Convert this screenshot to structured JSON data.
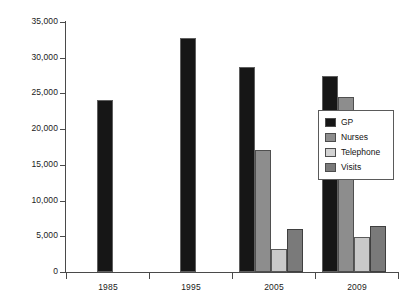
{
  "chart_data": {
    "type": "bar",
    "title": "",
    "subtitle": "",
    "xlabel": "",
    "ylabel": "",
    "categories": [
      "1985",
      "1995",
      "2005",
      "2009"
    ],
    "series": [
      {
        "name": "GP",
        "color": "#161616",
        "values": [
          24100,
          32800,
          28700,
          27450
        ]
      },
      {
        "name": "Nurses",
        "color": "#8d8d8d",
        "values": [
          null,
          null,
          17050,
          24450
        ]
      },
      {
        "name": "Telephone",
        "color": "#c9c9c9",
        "values": [
          null,
          null,
          3200,
          4900
        ]
      },
      {
        "name": "Visits",
        "color": "#7a7a7a",
        "values": [
          null,
          null,
          5950,
          6400
        ]
      }
    ],
    "ylim": [
      0,
      35000
    ],
    "ytick_values": [
      0,
      5000,
      10000,
      15000,
      20000,
      25000,
      30000,
      35000
    ],
    "ytick_labels": [
      "0",
      "5,000",
      "10,000",
      "15,000",
      "20,000",
      "25,000",
      "30,000",
      "35,000"
    ],
    "xtick_labels": [
      "1985",
      "1995",
      "2005",
      "2009"
    ],
    "grid": false,
    "legend": {
      "position": "right-middle",
      "entries": [
        {
          "label": "GP",
          "swatch": "series-gp"
        },
        {
          "label": "Nurses",
          "swatch": "series-nurses"
        },
        {
          "label": "Telephone",
          "swatch": "series-tel"
        },
        {
          "label": "Visits",
          "swatch": "series-visits"
        }
      ]
    }
  }
}
